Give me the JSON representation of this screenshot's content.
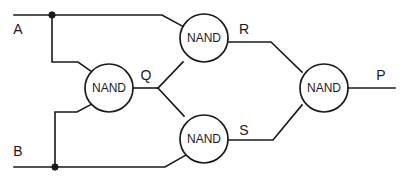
{
  "diagram": {
    "type": "logic-circuit",
    "colors": {
      "background": "#ffffff",
      "wire": "#1a1a1a",
      "gate_fill": "#ffffff",
      "gate_stroke": "#1a1a1a",
      "text": "#1a1a1a"
    },
    "gates": [
      {
        "id": "gate-q",
        "label": "NAND",
        "cx": 109,
        "cy": 88,
        "r": 24,
        "output_label": "Q",
        "inputs": [
          "A",
          "B"
        ]
      },
      {
        "id": "gate-r",
        "label": "NAND",
        "cx": 204,
        "cy": 38,
        "r": 24,
        "output_label": "R",
        "inputs": [
          "A",
          "Q"
        ]
      },
      {
        "id": "gate-s",
        "label": "NAND",
        "cx": 204,
        "cy": 139,
        "r": 24,
        "output_label": "S",
        "inputs": [
          "Q",
          "B"
        ]
      },
      {
        "id": "gate-p",
        "label": "NAND",
        "cx": 324,
        "cy": 88,
        "r": 24,
        "output_label": "P",
        "inputs": [
          "R",
          "S"
        ]
      }
    ],
    "inputs": [
      {
        "id": "input-a",
        "label": "A",
        "label_x": 18,
        "label_y": 30,
        "wire_y": 15
      },
      {
        "id": "input-b",
        "label": "B",
        "label_x": 18,
        "label_y": 152,
        "wire_y": 167
      }
    ],
    "outputs": [
      {
        "id": "output-p",
        "label": "P",
        "label_x": 381,
        "label_y": 76,
        "wire_y": 88
      }
    ],
    "node_labels": [
      {
        "id": "label-q",
        "text": "Q",
        "x": 146,
        "y": 76
      },
      {
        "id": "label-r",
        "text": "R",
        "x": 244,
        "y": 30
      },
      {
        "id": "label-s",
        "text": "S",
        "x": 244,
        "y": 131
      },
      {
        "id": "label-p",
        "text": "P",
        "x": 381,
        "y": 76
      },
      {
        "id": "label-a",
        "text": "A",
        "x": 18,
        "y": 30
      },
      {
        "id": "label-b",
        "text": "B",
        "x": 18,
        "y": 152
      }
    ],
    "junctions": [
      {
        "id": "junction-a",
        "x": 52,
        "y": 15,
        "r": 3.2
      },
      {
        "id": "junction-b",
        "x": 55,
        "y": 167,
        "r": 3.2
      }
    ],
    "wires": [
      {
        "id": "wire-a-main",
        "d": "M 14 15 L 162 15 L 184 27"
      },
      {
        "id": "wire-a-branch",
        "d": "M 52 15 L 52 62 L 78 62 L 92 72"
      },
      {
        "id": "wire-b-main",
        "d": "M 14 167 L 165 167 L 186 155"
      },
      {
        "id": "wire-b-branch",
        "d": "M 55 167 L 55 112 L 77 112 L 92 104"
      },
      {
        "id": "wire-q-stub",
        "d": "M 133 88 L 158 88"
      },
      {
        "id": "wire-q-to-r",
        "d": "M 158 88 L 183 62"
      },
      {
        "id": "wire-q-to-s",
        "d": "M 158 88 L 184 116"
      },
      {
        "id": "wire-r-out",
        "d": "M 228 42 L 271 42 L 302 72"
      },
      {
        "id": "wire-s-out",
        "d": "M 228 140 L 273 140 L 302 105"
      },
      {
        "id": "wire-p-out",
        "d": "M 348 88 L 395 88"
      }
    ]
  }
}
